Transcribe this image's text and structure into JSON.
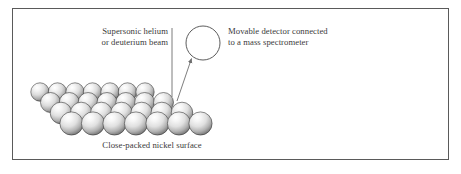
{
  "figure": {
    "title_alt": "Molecular beam scattering from a close-packed nickel surface",
    "background_color": "#ffffff",
    "border_color": "#5a5a5a",
    "text_color": "#3b3b3b"
  },
  "labels": {
    "beam_line1": "Supersonic helium",
    "beam_line2": "or deuterium beam",
    "detector_line1": "Movable detector connected",
    "detector_line2": "to a mass spectrometer",
    "surface_caption": "Close-packed nickel surface"
  },
  "diagram": {
    "detector": {
      "shape": "circle",
      "center_x": 203,
      "center_y": 43,
      "radius": 17,
      "stroke": "#4a4a4a"
    },
    "beam": {
      "shape": "vertical-line",
      "x": 172,
      "y_top": 28,
      "y_bottom": 97,
      "stroke": "#6e6e6e"
    },
    "scatter_arrow": {
      "shape": "arrow",
      "from_x": 178,
      "from_y": 100,
      "to_x": 192,
      "to_y": 57,
      "stroke": "#6e6e6e"
    },
    "lattice": {
      "type": "close-packed-spheres",
      "rows": 4,
      "per_row": 7,
      "sphere_radius_back": 9.2,
      "sphere_radius_front": 11.6,
      "origin_x": 40,
      "origin_y": 92,
      "row_dx": 10.5,
      "row_dy": 10.5,
      "col_dx": 17.5,
      "highlight_color": "#fdfdfd",
      "mid_color": "#d8d8d8",
      "shadow_color": "#6f6f6f",
      "outline_color": "#2e2e2e"
    }
  }
}
